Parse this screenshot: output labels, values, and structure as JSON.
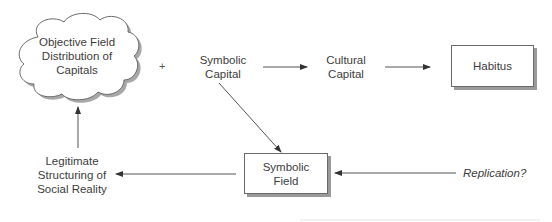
{
  "diagram": {
    "nodes": {
      "objective_field": {
        "shape": "cloud",
        "lines": [
          "Objective Field",
          "Distribution of",
          "Capitals"
        ]
      },
      "plus_sign": "+",
      "symbolic_capital": {
        "shape": "text",
        "lines": [
          "Symbolic",
          "Capital"
        ]
      },
      "cultural_capital": {
        "shape": "text",
        "lines": [
          "Cultural",
          "Capital"
        ]
      },
      "habitus": {
        "shape": "box",
        "lines": [
          "Habitus"
        ]
      },
      "symbolic_field": {
        "shape": "box",
        "lines": [
          "Symbolic",
          "Field"
        ]
      },
      "legitimate_structuring": {
        "shape": "text",
        "lines": [
          "Legitimate",
          "Structuring of",
          "Social Reality"
        ]
      },
      "replication": {
        "shape": "text",
        "style": "italic",
        "lines": [
          "Replication?"
        ]
      }
    },
    "edges": [
      {
        "from": "symbolic_capital",
        "to": "cultural_capital"
      },
      {
        "from": "cultural_capital",
        "to": "habitus"
      },
      {
        "from": "symbolic_capital",
        "to": "symbolic_field"
      },
      {
        "from": "replication",
        "to": "symbolic_field"
      },
      {
        "from": "symbolic_field",
        "to": "legitimate_structuring"
      },
      {
        "from": "legitimate_structuring",
        "to": "objective_field"
      }
    ],
    "colors": {
      "line": "#555555",
      "border": "#6a6a6a",
      "shadow": "#9a9a9a",
      "text": "#3c3c3c"
    }
  }
}
